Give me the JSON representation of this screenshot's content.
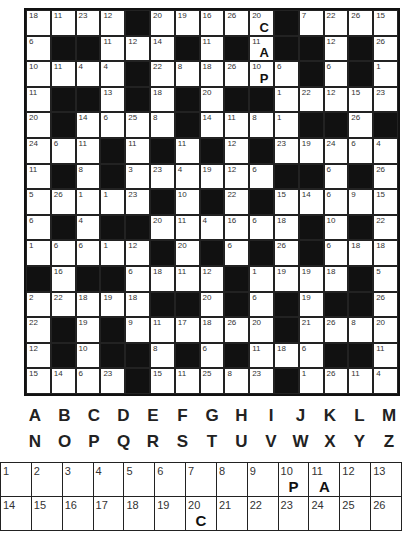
{
  "puzzle": {
    "type": "codeword",
    "rows": 15,
    "cols": 15,
    "grid": [
      [
        18,
        11,
        23,
        12,
        0,
        20,
        19,
        16,
        26,
        20,
        0,
        7,
        22,
        26,
        15
      ],
      [
        6,
        0,
        0,
        11,
        12,
        14,
        0,
        11,
        0,
        11,
        0,
        0,
        12,
        0,
        26
      ],
      [
        10,
        11,
        4,
        4,
        0,
        22,
        8,
        18,
        26,
        10,
        6,
        0,
        6,
        0,
        1
      ],
      [
        11,
        0,
        0,
        13,
        0,
        18,
        0,
        20,
        0,
        0,
        1,
        22,
        12,
        15,
        23
      ],
      [
        20,
        0,
        14,
        6,
        25,
        8,
        0,
        14,
        11,
        8,
        1,
        0,
        0,
        26,
        0
      ],
      [
        24,
        6,
        11,
        0,
        11,
        0,
        11,
        0,
        12,
        0,
        23,
        19,
        24,
        6,
        4
      ],
      [
        11,
        0,
        8,
        0,
        3,
        23,
        4,
        19,
        12,
        6,
        0,
        0,
        6,
        0,
        26
      ],
      [
        5,
        26,
        1,
        1,
        23,
        0,
        10,
        0,
        22,
        0,
        15,
        14,
        6,
        9,
        15
      ],
      [
        6,
        0,
        4,
        0,
        0,
        20,
        11,
        4,
        16,
        6,
        18,
        0,
        10,
        0,
        22
      ],
      [
        1,
        6,
        6,
        1,
        12,
        0,
        20,
        0,
        6,
        0,
        26,
        0,
        6,
        18,
        18
      ],
      [
        0,
        16,
        0,
        0,
        6,
        18,
        11,
        12,
        0,
        1,
        19,
        19,
        18,
        0,
        5
      ],
      [
        2,
        22,
        18,
        19,
        18,
        0,
        0,
        20,
        0,
        6,
        0,
        19,
        0,
        0,
        26
      ],
      [
        22,
        0,
        19,
        0,
        9,
        11,
        17,
        18,
        26,
        20,
        0,
        21,
        26,
        8,
        20
      ],
      [
        12,
        0,
        10,
        0,
        0,
        8,
        0,
        6,
        0,
        11,
        18,
        6,
        0,
        0,
        11
      ],
      [
        15,
        14,
        6,
        23,
        0,
        15,
        11,
        25,
        8,
        23,
        0,
        1,
        26,
        11,
        4
      ]
    ],
    "revealed_in_grid": [
      {
        "row": 0,
        "col": 9,
        "number": 20,
        "letter": "C"
      },
      {
        "row": 1,
        "col": 9,
        "number": 11,
        "letter": "A"
      },
      {
        "row": 2,
        "col": 9,
        "number": 10,
        "letter": "P"
      }
    ]
  },
  "alphabet": {
    "row1": [
      "A",
      "B",
      "C",
      "D",
      "E",
      "F",
      "G",
      "H",
      "I",
      "J",
      "K",
      "L",
      "M"
    ],
    "row2": [
      "N",
      "O",
      "P",
      "Q",
      "R",
      "S",
      "T",
      "U",
      "V",
      "W",
      "X",
      "Y",
      "Z"
    ]
  },
  "key": {
    "row1": [
      {
        "n": "1",
        "l": ""
      },
      {
        "n": "2",
        "l": ""
      },
      {
        "n": "3",
        "l": ""
      },
      {
        "n": "4",
        "l": ""
      },
      {
        "n": "5",
        "l": ""
      },
      {
        "n": "6",
        "l": ""
      },
      {
        "n": "7",
        "l": ""
      },
      {
        "n": "8",
        "l": ""
      },
      {
        "n": "9",
        "l": ""
      },
      {
        "n": "10",
        "l": "P"
      },
      {
        "n": "11",
        "l": "A"
      },
      {
        "n": "12",
        "l": ""
      },
      {
        "n": "13",
        "l": ""
      }
    ],
    "row2": [
      {
        "n": "14",
        "l": ""
      },
      {
        "n": "15",
        "l": ""
      },
      {
        "n": "16",
        "l": ""
      },
      {
        "n": "17",
        "l": ""
      },
      {
        "n": "18",
        "l": ""
      },
      {
        "n": "19",
        "l": ""
      },
      {
        "n": "20",
        "l": "C"
      },
      {
        "n": "21",
        "l": ""
      },
      {
        "n": "22",
        "l": ""
      },
      {
        "n": "23",
        "l": ""
      },
      {
        "n": "24",
        "l": ""
      },
      {
        "n": "25",
        "l": ""
      },
      {
        "n": "26",
        "l": ""
      }
    ]
  }
}
